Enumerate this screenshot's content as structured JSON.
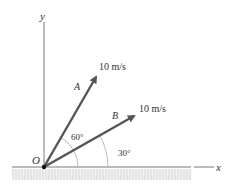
{
  "diagram": {
    "axes": {
      "x_label": "x",
      "y_label": "y",
      "origin_label": "O"
    },
    "vectors": [
      {
        "name": "A",
        "magnitude_label": "10 m/s",
        "angle_label": "60°",
        "angle_deg": 60
      },
      {
        "name": "B",
        "magnitude_label": "10 m/s",
        "angle_label": "30°",
        "angle_deg": 30
      }
    ],
    "colors": {
      "vector": "#555555",
      "axis": "#777777",
      "arc": "#aaaaaa",
      "ground": "#dddddd"
    }
  }
}
